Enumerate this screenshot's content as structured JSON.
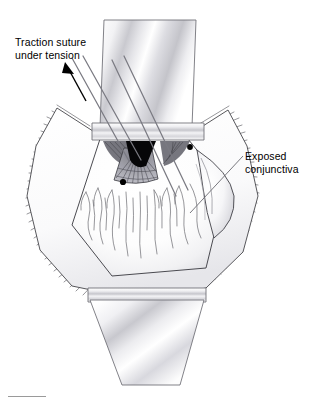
{
  "figure": {
    "width": 321,
    "height": 408,
    "background_color": "#ffffff"
  },
  "annotations": {
    "traction_suture": {
      "text": "Traction suture\nunder tension",
      "line1": "Traction suture",
      "line2": "under tension",
      "pointer": "arrow",
      "color": "#000000"
    },
    "exposed_conjunctiva": {
      "text": "Exposed\nconjunctiva",
      "line1": "Exposed",
      "line2": "conjunctiva",
      "pointer": "leader-line",
      "color": "#000000"
    }
  },
  "anatomy": {
    "globe_label": "eye globe",
    "sclera_color": "#ffffff",
    "iris_label": "iris",
    "pupil_label": "pupil",
    "pupil_color": "#000000",
    "conjunctiva_label": "exposed conjunctiva fold",
    "vessel_color": "#6e6e74",
    "vessel_count": 22,
    "eyelash_color": "#6a6a70",
    "eyelid_margin_color": "#3a3a3e"
  },
  "instruments": {
    "speculum_upper_label": "upper lid speculum blade",
    "speculum_lower_label": "lower lid speculum blade",
    "metal_highlight": "#ffffff",
    "metal_shadow": "#b9b9bf",
    "suture_label": "traction suture thread",
    "suture_color": "#7a7a82",
    "suture_strands": 2,
    "knot_marker_color": "#000000"
  },
  "footer": {
    "rule_color": "#9a9a9a"
  }
}
